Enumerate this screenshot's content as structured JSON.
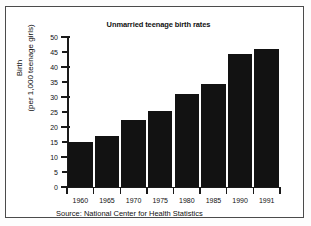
{
  "chart_data": {
    "type": "bar",
    "title": "Unmarried teenage birth rates",
    "categories": [
      "1960",
      "1965",
      "1970",
      "1975",
      "1980",
      "1985",
      "1990",
      "1991"
    ],
    "values": [
      15,
      17,
      22.5,
      25.5,
      31,
      34.5,
      44.5,
      46
    ],
    "xlabel": "",
    "ylabel_line1": "Birth",
    "ylabel_line2": "(per 1,000 teenage girls)",
    "ylim": [
      0,
      50
    ],
    "ytick_values": [
      0,
      5,
      10,
      15,
      20,
      25,
      30,
      35,
      40,
      45,
      50
    ],
    "ytick_labels": [
      "0",
      "5",
      "10",
      "15",
      "20",
      "25",
      "30",
      "35",
      "40",
      "45",
      "50"
    ],
    "grid": false,
    "legend": "none",
    "bar_color": "#121212",
    "source": "Source: National Center for Health Statistics"
  }
}
